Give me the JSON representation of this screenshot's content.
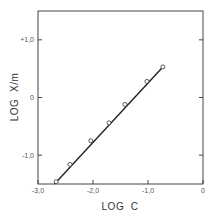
{
  "chart_data": {
    "type": "line",
    "title": "",
    "xlabel": "LOG  C",
    "ylabel": "LOG  X/m",
    "xlim": [
      -3.0,
      0
    ],
    "ylim": [
      -1.5,
      1.5
    ],
    "grid": false,
    "legend": null,
    "x_ticks": [
      {
        "value": -3.0,
        "label": "-3,0"
      },
      {
        "value": -2.0,
        "label": "-2,0"
      },
      {
        "value": -1.0,
        "label": "-1,0"
      },
      {
        "value": 0,
        "label": "0"
      }
    ],
    "y_ticks": [
      {
        "value": 1.0,
        "label": "+1,0"
      },
      {
        "value": 0,
        "label": "0"
      },
      {
        "value": -1.0,
        "label": "-1,0"
      }
    ],
    "series": [
      {
        "name": "data",
        "marker": "open-circle",
        "x": [
          -2.67,
          -2.42,
          -2.04,
          -1.71,
          -1.42,
          -1.02,
          -0.73
        ],
        "y": [
          -1.46,
          -1.16,
          -0.75,
          -0.44,
          -0.12,
          0.28,
          0.53
        ]
      }
    ],
    "fit_line": {
      "x": [
        -2.7,
        -0.73
      ],
      "y": [
        -1.5,
        0.53
      ]
    }
  }
}
